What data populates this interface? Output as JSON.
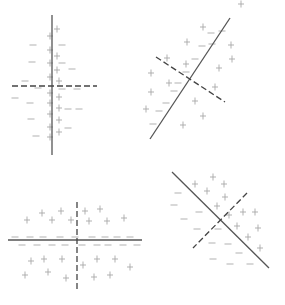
{
  "colors": {
    "background": "#ffffff",
    "solid_line": "#555555",
    "dashed_line": "#444444",
    "marks": "#a8a8a8"
  },
  "panels": [
    {
      "id": "top-left",
      "solid_line": [
        [
          52,
          15
        ],
        [
          52,
          155
        ]
      ],
      "dashed_line": [
        [
          12,
          86
        ],
        [
          97,
          86
        ]
      ],
      "plus": [
        [
          57,
          29
        ],
        [
          50,
          36
        ],
        [
          50,
          50
        ],
        [
          57,
          56
        ],
        [
          50,
          63
        ],
        [
          57,
          70
        ],
        [
          50,
          77
        ],
        [
          59,
          81
        ],
        [
          50,
          93
        ],
        [
          59,
          97
        ],
        [
          50,
          103
        ],
        [
          59,
          108
        ],
        [
          50,
          114
        ],
        [
          59,
          120
        ],
        [
          50,
          127
        ],
        [
          59,
          132
        ],
        [
          50,
          137
        ]
      ],
      "minus": [
        [
          33,
          45
        ],
        [
          62,
          45
        ],
        [
          32,
          62
        ],
        [
          62,
          63
        ],
        [
          72,
          69
        ],
        [
          25,
          81
        ],
        [
          38,
          88
        ],
        [
          62,
          89
        ],
        [
          77,
          89
        ],
        [
          15,
          98
        ],
        [
          30,
          103
        ],
        [
          68,
          109
        ],
        [
          79,
          109
        ],
        [
          31,
          119
        ],
        [
          68,
          128
        ],
        [
          36,
          136
        ]
      ]
    },
    {
      "id": "top-right",
      "solid_line": [
        [
          230,
          18
        ],
        [
          150,
          139
        ]
      ],
      "dashed_line": [
        [
          156,
          57
        ],
        [
          225,
          102
        ]
      ],
      "plus": [
        [
          203,
          27
        ],
        [
          187,
          42
        ],
        [
          231,
          45
        ],
        [
          232,
          59
        ],
        [
          167,
          58
        ],
        [
          186,
          64
        ],
        [
          219,
          68
        ],
        [
          151,
          73
        ],
        [
          169,
          83
        ],
        [
          215,
          87
        ],
        [
          151,
          92
        ],
        [
          195,
          101
        ],
        [
          146,
          109
        ],
        [
          203,
          116
        ],
        [
          183,
          125
        ],
        [
          241,
          4
        ]
      ],
      "minus": [
        [
          211,
          33
        ],
        [
          202,
          46
        ],
        [
          212,
          44
        ],
        [
          195,
          59
        ],
        [
          186,
          72
        ],
        [
          178,
          83
        ],
        [
          174,
          91
        ],
        [
          166,
          103
        ],
        [
          159,
          111
        ],
        [
          153,
          124
        ],
        [
          222,
          31
        ]
      ]
    },
    {
      "id": "bottom-left",
      "solid_line": [
        [
          8,
          240
        ],
        [
          142,
          240
        ]
      ],
      "dashed_line": [
        [
          77,
          202
        ],
        [
          77,
          292
        ]
      ],
      "plus": [
        [
          42,
          213
        ],
        [
          61,
          211
        ],
        [
          27,
          220
        ],
        [
          52,
          220
        ],
        [
          71,
          220
        ],
        [
          85,
          211
        ],
        [
          100,
          209
        ],
        [
          89,
          221
        ],
        [
          107,
          221
        ],
        [
          124,
          218
        ],
        [
          31,
          261
        ],
        [
          44,
          259
        ],
        [
          62,
          259
        ],
        [
          83,
          265
        ],
        [
          97,
          259
        ],
        [
          115,
          259
        ],
        [
          130,
          267
        ],
        [
          25,
          275
        ],
        [
          48,
          272
        ],
        [
          66,
          278
        ],
        [
          94,
          277
        ],
        [
          110,
          275
        ]
      ],
      "minus": [
        [
          15,
          237
        ],
        [
          30,
          237
        ],
        [
          43,
          237
        ],
        [
          60,
          237
        ],
        [
          75,
          237
        ],
        [
          92,
          237
        ],
        [
          105,
          237
        ],
        [
          117,
          237
        ],
        [
          130,
          237
        ],
        [
          22,
          245
        ],
        [
          37,
          245
        ],
        [
          52,
          245
        ],
        [
          65,
          245
        ],
        [
          82,
          245
        ],
        [
          97,
          245
        ],
        [
          108,
          245
        ],
        [
          123,
          245
        ],
        [
          137,
          245
        ]
      ]
    },
    {
      "id": "bottom-right",
      "solid_line": [
        [
          172,
          172
        ],
        [
          269,
          268
        ]
      ],
      "dashed_line": [
        [
          247,
          193
        ],
        [
          193,
          248
        ]
      ],
      "plus": [
        [
          213,
          177
        ],
        [
          195,
          184
        ],
        [
          224,
          184
        ],
        [
          207,
          191
        ],
        [
          225,
          197
        ],
        [
          217,
          206
        ],
        [
          229,
          215
        ],
        [
          243,
          212
        ],
        [
          255,
          212
        ],
        [
          237,
          226
        ],
        [
          258,
          228
        ],
        [
          248,
          237
        ],
        [
          260,
          248
        ]
      ],
      "minus": [
        [
          178,
          193
        ],
        [
          174,
          205
        ],
        [
          199,
          212
        ],
        [
          184,
          219
        ],
        [
          197,
          229
        ],
        [
          218,
          229
        ],
        [
          212,
          243
        ],
        [
          228,
          244
        ],
        [
          239,
          253
        ],
        [
          213,
          259
        ],
        [
          230,
          264
        ],
        [
          250,
          264
        ]
      ]
    }
  ]
}
